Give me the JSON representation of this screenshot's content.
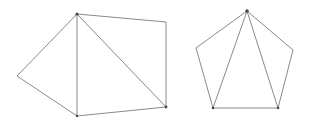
{
  "canvas": {
    "width": 311,
    "height": 125,
    "background_color": "#ffffff"
  },
  "style": {
    "stroke_color": "#8a8a8a",
    "stroke_color_dark": "#6f6f6f",
    "vertex_dot_color": "#4a4a4a",
    "stroke_width": 1,
    "fill": "none"
  },
  "figures": [
    {
      "id": "left-figure",
      "name": "triangulated-pentagon-left",
      "shape_type": "pentagon",
      "outline_points": "17,76 77,14 166,22 166,107 77,116",
      "vertices": [
        {
          "label": "left-apex",
          "x": 17,
          "y": 76
        },
        {
          "label": "top-left",
          "x": 77,
          "y": 14
        },
        {
          "label": "top-right",
          "x": 166,
          "y": 22
        },
        {
          "label": "bottom-right",
          "x": 166,
          "y": 107
        },
        {
          "label": "bottom-left",
          "x": 77,
          "y": 116
        }
      ],
      "diagonals": [
        {
          "label": "vertical-chord",
          "x1": 77,
          "y1": 14,
          "x2": 77,
          "y2": 116
        },
        {
          "label": "main-diagonal",
          "x1": 77,
          "y1": 14,
          "x2": 166,
          "y2": 107
        }
      ],
      "triangle_count": 3,
      "marked_vertices": [
        {
          "label": "top-left-dot",
          "x": 77,
          "y": 14,
          "r": 1.6
        },
        {
          "label": "bottom-right-dot",
          "x": 166,
          "y": 107,
          "r": 1.4
        },
        {
          "label": "bottom-left-dot",
          "x": 77,
          "y": 116,
          "r": 1.2
        }
      ]
    },
    {
      "id": "right-figure",
      "name": "triangulated-pentagon-right",
      "shape_type": "pentagon",
      "outline_points": "247,11 293,50 278,108 213,108 196,48",
      "vertices": [
        {
          "label": "apex",
          "x": 247,
          "y": 11
        },
        {
          "label": "right-upper",
          "x": 293,
          "y": 50
        },
        {
          "label": "right-lower",
          "x": 278,
          "y": 108
        },
        {
          "label": "left-lower",
          "x": 213,
          "y": 108
        },
        {
          "label": "left-upper",
          "x": 196,
          "y": 48
        }
      ],
      "diagonals": [
        {
          "label": "apex-to-left-lower",
          "x1": 247,
          "y1": 11,
          "x2": 213,
          "y2": 108
        },
        {
          "label": "apex-to-right-lower",
          "x1": 247,
          "y1": 11,
          "x2": 278,
          "y2": 108
        }
      ],
      "triangle_count": 3,
      "marked_vertices": [
        {
          "label": "apex-dot",
          "x": 247,
          "y": 11,
          "r": 1.8
        },
        {
          "label": "left-lower-dot",
          "x": 213,
          "y": 108,
          "r": 1.3
        },
        {
          "label": "right-lower-dot",
          "x": 278,
          "y": 108,
          "r": 1.3
        }
      ]
    }
  ]
}
